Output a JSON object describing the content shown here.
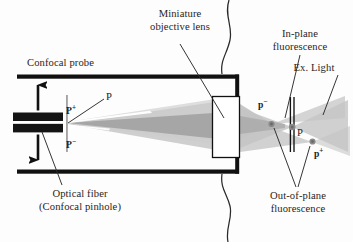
{
  "figure": {
    "background_color": "#fdfdfd",
    "ink_color": "#1b1b1b",
    "beam_color": "#c9c9c9",
    "beam_overlap_color": "#a8a8a8",
    "width": 353,
    "height": 242
  },
  "labels": {
    "confocal_probe": "Confocal probe",
    "miniature_objective_lens_line1": "Miniature",
    "miniature_objective_lens_line2": "objective lens",
    "in_plane_fluorescence_line1": "In-plane",
    "in_plane_fluorescence_line2": "fluorescence",
    "ex_light": "Ex. Light",
    "out_of_plane_fluorescence_line1": "Out-of-plane",
    "out_of_plane_fluorescence_line2": "fluorescence",
    "optical_fiber_line1": "Optical fiber",
    "optical_fiber_line2": "(Confocal pinhole)"
  },
  "markers": {
    "p_plus_source": "P",
    "p_plus_source_sup": "+",
    "p_minus_source": "P",
    "p_minus_source_sup": "−",
    "p_axis_source": "P",
    "p_minus_focus": "p",
    "p_minus_focus_sup": "−",
    "p_focus": "P",
    "p_plus_focus": "p",
    "p_plus_focus_sup": "+"
  },
  "components": {
    "probe_housing": "probe-housing",
    "optical_fiber": "optical-fiber",
    "objective_lens": "objective-lens",
    "tissue_surface": "tissue-surface",
    "scan_arrow_up": "scan-arrow-up",
    "scan_arrow_down": "scan-arrow-down",
    "focal_plane_line": "focal-plane-line"
  }
}
